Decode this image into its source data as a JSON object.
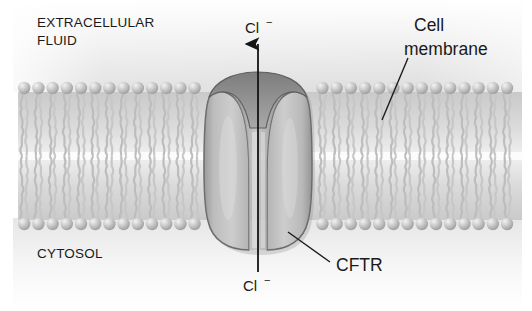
{
  "figure": {
    "width": 532,
    "height": 311
  },
  "labels": {
    "extracellular_line1": "EXTRACELLULAR",
    "extracellular_line2": "FLUID",
    "cytosol": "CYTOSOL",
    "cell_membrane_line1": "Cell",
    "cell_membrane_line2": "membrane",
    "protein_name": "CFTR",
    "ion_top_symbol": "Cl",
    "ion_top_charge": "−",
    "ion_bottom_symbol": "Cl",
    "ion_bottom_charge": "−"
  },
  "colors": {
    "background": "#ffffff",
    "extracellular_fluid": "#e4e4e4",
    "cytosol_fluid": "#f4f4f4",
    "lipid_head": "#b9b9b9",
    "lipid_head_highlight": "#eeeeee",
    "lipid_tail": "#c9c9c9",
    "protein_body": "#bcbcbc",
    "protein_outline": "#6d6d6d",
    "protein_shadow": "#8f8f8f",
    "pore": "#c8c8c8",
    "text": "#1a1a1a",
    "leader_line": "#1d1d1d"
  },
  "geometry": {
    "membrane_top_y": 88,
    "membrane_bottom_y": 224,
    "membrane_left_x": 18,
    "membrane_right_x": 522,
    "channel_center_x": 258,
    "protein_left_x": 209,
    "protein_right_x": 305
  },
  "annotations": [
    {
      "name": "cell-membrane-leader",
      "from_x": 408,
      "from_y": 58,
      "to_x": 382,
      "to_y": 120
    },
    {
      "name": "cftr-leader",
      "from_x": 330,
      "from_y": 262,
      "to_x": 288,
      "to_y": 232
    }
  ],
  "transport": {
    "direction": "outward",
    "description": "Chloride ions move from the cytosol through the CFTR pore to the extracellular fluid",
    "arrow_from_y": 270,
    "arrow_to_y": 44
  }
}
